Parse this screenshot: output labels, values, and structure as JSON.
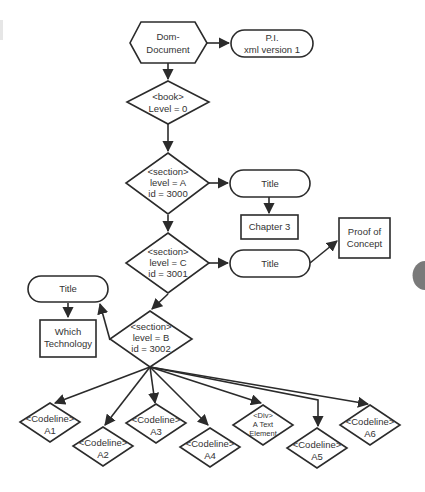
{
  "diagram": {
    "type": "DOM tree flowchart",
    "nodes": {
      "dom_document": {
        "shape": "hexagon",
        "lines": [
          "Dom-",
          "Document"
        ]
      },
      "pi": {
        "shape": "pill",
        "lines": [
          "P.I.",
          "xml version 1"
        ]
      },
      "book": {
        "shape": "diamond",
        "lines": [
          "<book>",
          "Level = 0"
        ]
      },
      "section_a": {
        "shape": "diamond",
        "lines": [
          "<section>",
          "level = A",
          "id = 3000"
        ]
      },
      "title_a": {
        "shape": "pill",
        "lines": [
          "Title"
        ]
      },
      "chapter3": {
        "shape": "rect",
        "lines": [
          "Chapter 3"
        ]
      },
      "section_c": {
        "shape": "diamond",
        "lines": [
          "<section>",
          "level = C",
          "id = 3001"
        ]
      },
      "title_c": {
        "shape": "pill",
        "lines": [
          "Title"
        ]
      },
      "proof": {
        "shape": "rect",
        "lines": [
          "Proof of",
          "Concept"
        ]
      },
      "title_b": {
        "shape": "pill",
        "lines": [
          "Title"
        ]
      },
      "which_tech": {
        "shape": "rect",
        "lines": [
          "Which",
          "Technology"
        ]
      },
      "section_b": {
        "shape": "diamond",
        "lines": [
          "<section>",
          "level = B",
          "id = 3002"
        ]
      },
      "a1": {
        "shape": "diamond",
        "lines": [
          "<Codeline>",
          "A1"
        ]
      },
      "a2": {
        "shape": "diamond",
        "lines": [
          "<Codeline>",
          "A2"
        ]
      },
      "a3": {
        "shape": "diamond",
        "lines": [
          "<Codeline>",
          "A3"
        ]
      },
      "a4": {
        "shape": "diamond",
        "lines": [
          "<Codeline>",
          "A4"
        ]
      },
      "div": {
        "shape": "diamond",
        "lines": [
          "<Div>",
          "A Text",
          "Element"
        ]
      },
      "a5": {
        "shape": "diamond",
        "lines": [
          "<Codeline>",
          "A5"
        ]
      },
      "a6": {
        "shape": "diamond",
        "lines": [
          "<Codeline>",
          "A6"
        ]
      }
    },
    "edges": [
      [
        "dom_document",
        "pi"
      ],
      [
        "dom_document",
        "book"
      ],
      [
        "book",
        "section_a"
      ],
      [
        "section_a",
        "title_a"
      ],
      [
        "title_a",
        "chapter3"
      ],
      [
        "section_a",
        "section_c"
      ],
      [
        "section_c",
        "title_c"
      ],
      [
        "title_c",
        "proof"
      ],
      [
        "section_c",
        "section_b"
      ],
      [
        "section_b",
        "title_b"
      ],
      [
        "title_b",
        "which_tech"
      ],
      [
        "section_b",
        "a1"
      ],
      [
        "section_b",
        "a2"
      ],
      [
        "section_b",
        "a3"
      ],
      [
        "section_b",
        "a4"
      ],
      [
        "section_b",
        "div"
      ],
      [
        "section_b",
        "a5"
      ],
      [
        "section_b",
        "a6"
      ]
    ],
    "colors": {
      "stroke": "#2b2b2b",
      "text": "#333333",
      "background": "#ffffff",
      "side_tab": "#7a7a7a"
    }
  }
}
